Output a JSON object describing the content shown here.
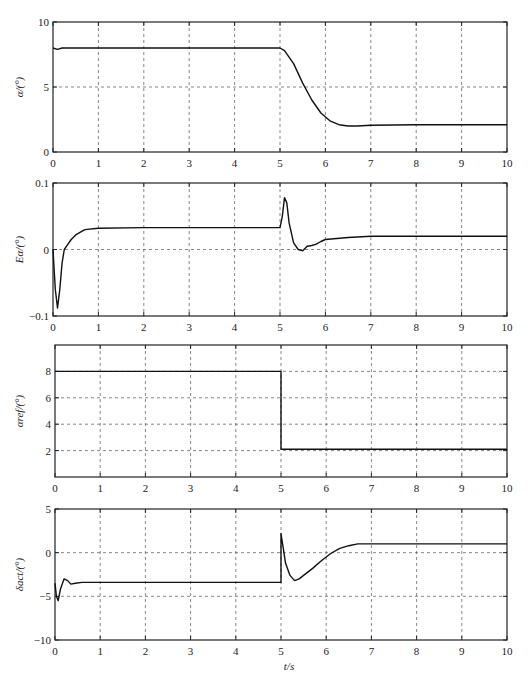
{
  "chart_data": [
    {
      "type": "line",
      "title": "",
      "xlabel": "",
      "ylabel": "α/(°)",
      "xlim": [
        0,
        10
      ],
      "ylim": [
        0,
        10
      ],
      "xticks": [
        "0",
        "1",
        "2",
        "3",
        "4",
        "5",
        "6",
        "7",
        "8",
        "9",
        "10"
      ],
      "yticks": [
        "0",
        "5",
        "10"
      ],
      "grid": true,
      "series": [
        {
          "name": "alpha",
          "x": [
            0,
            0.1,
            0.2,
            0.5,
            1,
            2,
            3,
            4,
            5,
            5.1,
            5.3,
            5.5,
            5.7,
            5.9,
            6.1,
            6.3,
            6.5,
            6.7,
            7,
            8,
            9,
            10
          ],
          "y": [
            8,
            7.9,
            8,
            8,
            8,
            8,
            8,
            8,
            8,
            7.8,
            6.8,
            5.3,
            4.0,
            3.0,
            2.4,
            2.1,
            2.0,
            2.0,
            2.05,
            2.1,
            2.1,
            2.1
          ]
        }
      ]
    },
    {
      "type": "line",
      "title": "",
      "xlabel": "",
      "ylabel": "Eα/(°)",
      "xlim": [
        0,
        10
      ],
      "ylim": [
        -0.1,
        0.1
      ],
      "xticks": [
        "0",
        "1",
        "2",
        "3",
        "4",
        "5",
        "6",
        "7",
        "8",
        "9",
        "10"
      ],
      "yticks": [
        "-0.1",
        "0",
        "0.1"
      ],
      "grid": true,
      "series": [
        {
          "name": "E_alpha",
          "x": [
            0,
            0.05,
            0.1,
            0.15,
            0.2,
            0.25,
            0.3,
            0.4,
            0.5,
            0.7,
            1,
            2,
            3,
            4,
            5,
            5.05,
            5.1,
            5.15,
            5.2,
            5.3,
            5.4,
            5.5,
            5.6,
            5.7,
            5.8,
            5.9,
            6,
            6.5,
            7,
            8,
            9,
            10
          ],
          "y": [
            0,
            -0.06,
            -0.088,
            -0.06,
            -0.02,
            0,
            0.005,
            0.015,
            0.022,
            0.03,
            0.032,
            0.033,
            0.033,
            0.033,
            0.033,
            0.05,
            0.078,
            0.07,
            0.04,
            0.01,
            0,
            -0.002,
            0.005,
            0.006,
            0.008,
            0.012,
            0.015,
            0.018,
            0.02,
            0.02,
            0.02,
            0.02
          ]
        }
      ]
    },
    {
      "type": "line",
      "title": "",
      "xlabel": "",
      "ylabel": "αref/(°)",
      "xlim": [
        0,
        10
      ],
      "ylim": [
        0,
        10
      ],
      "xticks": [
        "0",
        "1",
        "2",
        "3",
        "4",
        "5",
        "6",
        "7",
        "8",
        "9",
        "10"
      ],
      "yticks": [
        "2",
        "4",
        "6",
        "8"
      ],
      "grid": true,
      "series": [
        {
          "name": "alpha_ref",
          "x": [
            0,
            5,
            5,
            10
          ],
          "y": [
            8,
            8,
            2.1,
            2.1
          ]
        }
      ]
    },
    {
      "type": "line",
      "title": "",
      "xlabel": "t/s",
      "ylabel": "δact/(°)",
      "xlim": [
        0,
        10
      ],
      "ylim": [
        -10,
        5
      ],
      "xticks": [
        "0",
        "1",
        "2",
        "3",
        "4",
        "5",
        "6",
        "7",
        "8",
        "9",
        "10"
      ],
      "yticks": [
        "-10",
        "-5",
        "0",
        "5"
      ],
      "grid": true,
      "series": [
        {
          "name": "delta_act",
          "x": [
            0,
            0.03,
            0.07,
            0.12,
            0.2,
            0.28,
            0.35,
            0.45,
            0.6,
            1,
            2,
            3,
            4,
            5,
            5.0,
            5.02,
            5.05,
            5.1,
            5.2,
            5.3,
            5.4,
            5.5,
            5.7,
            5.9,
            6.1,
            6.3,
            6.5,
            6.7,
            7,
            8,
            9,
            10
          ],
          "y": [
            -3.5,
            -5,
            -5.5,
            -4.2,
            -3,
            -3.2,
            -3.6,
            -3.5,
            -3.4,
            -3.4,
            -3.4,
            -3.4,
            -3.4,
            -3.4,
            2.2,
            1.5,
            0.5,
            -1.2,
            -2.6,
            -3.2,
            -3.0,
            -2.6,
            -1.8,
            -0.9,
            -0.1,
            0.5,
            0.8,
            1.0,
            1.0,
            1.0,
            1.0,
            1.0
          ]
        }
      ]
    }
  ],
  "figure": {
    "xlabel_bottom": "t/s"
  }
}
